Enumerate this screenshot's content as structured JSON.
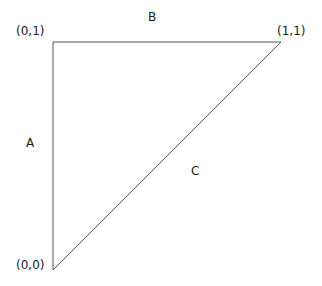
{
  "diagram": {
    "type": "right-triangle",
    "vertices": [
      {
        "id": "origin",
        "label": "(0,0)",
        "x": 53,
        "y": 270
      },
      {
        "id": "top-left",
        "label": "(0,1)",
        "x": 53,
        "y": 42
      },
      {
        "id": "top-right",
        "label": "(1,1)",
        "x": 281,
        "y": 42
      }
    ],
    "sides": [
      {
        "id": "A",
        "label": "A",
        "from": "origin",
        "to": "top-left"
      },
      {
        "id": "B",
        "label": "B",
        "from": "top-left",
        "to": "top-right"
      },
      {
        "id": "C",
        "label": "C",
        "from": "origin",
        "to": "top-right"
      }
    ],
    "line_color": "#555555"
  },
  "labels": {
    "vertex_origin": "(0,0)",
    "vertex_top_left": "(0,1)",
    "vertex_top_right": "(1,1)",
    "side_a": "A",
    "side_b": "B",
    "side_c": "C"
  }
}
